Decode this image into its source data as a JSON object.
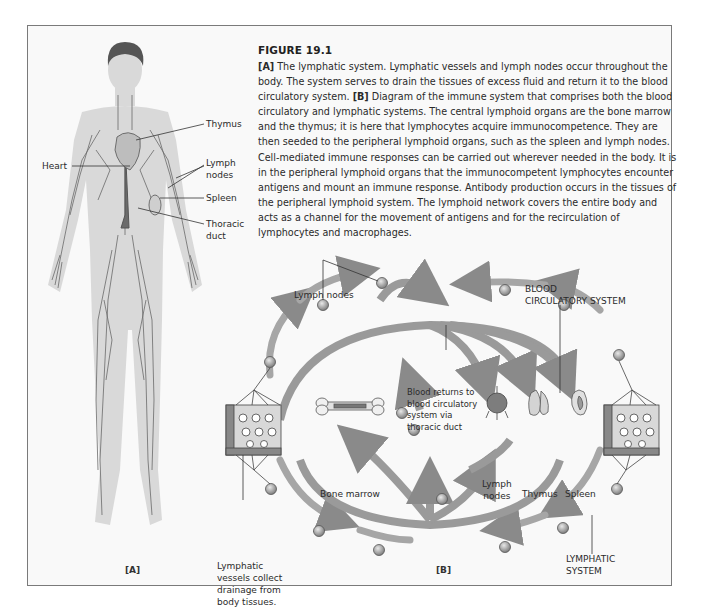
{
  "figure": {
    "title": "FIGURE 19.1",
    "caption_parts": [
      {
        "bold": "[A]",
        "text": " The lymphatic system. Lymphatic vessels and lymph nodes occur throughout the body. The system serves to drain the tissues of excess fluid and return it to the blood circulatory system. "
      },
      {
        "bold": "[B]",
        "text": " Diagram of the immune system that comprises both the blood circulatory and lymphatic systems. The central lymphoid organs are the bone marrow and the thymus; it is here that lymphocytes acquire immunocompetence. They are then seeded to the peripheral lymphoid organs, such as the spleen and lymph nodes. Cell-mediated immune responses can be carried out wherever needed in the body. It is in the peripheral lymphoid organs that the immunocompetent lymphocytes encounter antigens and mount an immune response. Antibody production occurs in the tissues of the peripheral lymphoid system. The lymphoid network covers the entire body and acts as a channel for the movement of antigens and for the recirculation of lymphocytes and macrophages."
      }
    ]
  },
  "panel_a": {
    "label": "[A]",
    "annotations": {
      "thymus": "Thymus",
      "heart": "Heart",
      "lymph_nodes": "Lymph\nnodes",
      "spleen": "Spleen",
      "thoracic_duct": "Thoracic\nduct"
    }
  },
  "panel_b": {
    "label": "[B]",
    "annotations": {
      "lymph_nodes_top": "Lymph nodes",
      "blood_system": "BLOOD\nCIRCULATORY SYSTEM",
      "blood_returns": "Blood returns to\nblood circulatory\nsystem via\nthoracic duct",
      "bone_marrow": "Bone marrow",
      "lymph_nodes_organ": "Lymph\nnodes",
      "thymus": "Thymus",
      "spleen": "Spleen",
      "lymphatic_vessels": "Lymphatic\nvessels collect\ndrainage from\nbody tissues.",
      "lymphatic_system": "LYMPHATIC\nSYSTEM"
    }
  },
  "colors": {
    "frame_border": "#7a7a7a",
    "frame_bg": "#f9f9f9",
    "body_silhouette": "#d6d6d6",
    "vessel": "#555555",
    "arrow": "#9a9a9a",
    "node": "#8c8c8c"
  }
}
